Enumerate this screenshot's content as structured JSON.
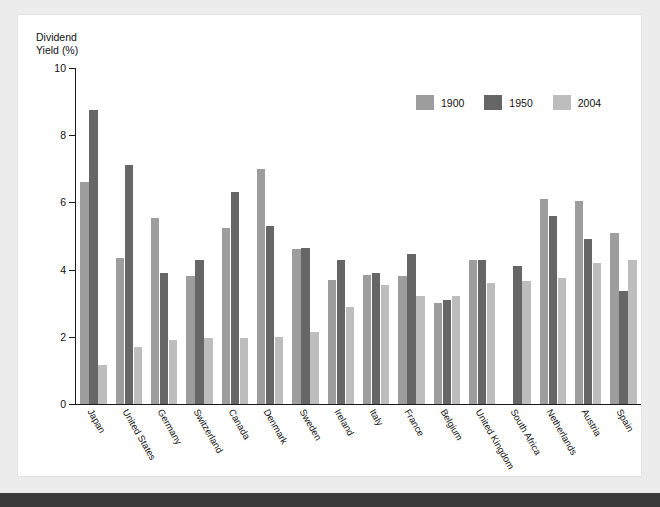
{
  "chart_data": {
    "type": "bar",
    "title": "",
    "subtitle": "",
    "xlabel": "",
    "ylabel": "Dividend\nYield (%)",
    "ylim": [
      0,
      10
    ],
    "yticks": [
      0,
      2,
      4,
      6,
      8,
      10
    ],
    "ytick_labels": [
      "0",
      "2",
      "4",
      "6",
      "8",
      "10"
    ],
    "grid": false,
    "legend_position": "top-right",
    "categories": [
      "Japan",
      "United States",
      "Germany",
      "Switzerland",
      "Canada",
      "Denmark",
      "Sweden",
      "Ireland",
      "Italy",
      "France",
      "Belgium",
      "United Kingdom",
      "South Africa",
      "Netherlands",
      "Austria",
      "Spain"
    ],
    "series": [
      {
        "name": "1900",
        "color": "#9d9d9d",
        "values": [
          6.6,
          4.35,
          5.55,
          3.8,
          5.25,
          7.0,
          4.6,
          3.7,
          3.85,
          3.8,
          3.0,
          4.3,
          null,
          6.1,
          6.05,
          5.1
        ]
      },
      {
        "name": "1950",
        "color": "#666666",
        "values": [
          8.75,
          7.1,
          3.9,
          4.3,
          6.3,
          5.3,
          4.65,
          4.3,
          3.9,
          4.45,
          3.1,
          4.3,
          4.1,
          5.6,
          4.9,
          3.35
        ]
      },
      {
        "name": "2004",
        "color": "#bdbdbd",
        "values": [
          1.15,
          1.7,
          1.9,
          1.95,
          1.95,
          2.0,
          2.15,
          2.9,
          3.55,
          3.2,
          3.2,
          3.6,
          3.65,
          3.75,
          4.2,
          4.3
        ]
      }
    ]
  },
  "legend": {
    "items": [
      {
        "label": "1900",
        "key": "s1900"
      },
      {
        "label": "1950",
        "key": "s1950"
      },
      {
        "label": "2004",
        "key": "s2004"
      }
    ]
  },
  "axis": {
    "y_title": "Dividend\nYield (%)"
  }
}
